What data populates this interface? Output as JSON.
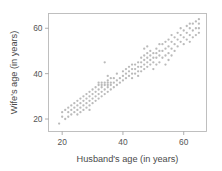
{
  "chart_data": {
    "type": "scatter",
    "title": "",
    "xlabel": "Husband's age (in years)",
    "ylabel": "Wife's age (in years)",
    "xlim": [
      15.5,
      67.5
    ],
    "ylim": [
      14.5,
      66.5
    ],
    "xticks": [
      20,
      40,
      60
    ],
    "yticks": [
      20,
      40,
      60
    ],
    "xticklabels": [
      "20",
      "40",
      "60"
    ],
    "yticklabels": [
      "20",
      "40",
      "60"
    ],
    "grid": false,
    "legend": null,
    "point_color": "#b0b0b0",
    "frame_color": "#b9b9b9",
    "background_color": "#ffffff",
    "series": [
      {
        "name": "couples",
        "n_points": 170,
        "x": [
          19,
          20,
          20,
          21,
          21,
          22,
          22,
          22,
          23,
          23,
          23,
          24,
          24,
          24,
          25,
          25,
          25,
          25,
          26,
          26,
          26,
          26,
          27,
          27,
          27,
          27,
          28,
          28,
          28,
          28,
          29,
          29,
          29,
          29,
          29,
          30,
          30,
          30,
          30,
          31,
          31,
          31,
          31,
          32,
          32,
          32,
          32,
          32,
          33,
          33,
          33,
          33,
          33,
          34,
          34,
          34,
          34,
          34,
          35,
          35,
          35,
          35,
          35,
          35,
          36,
          36,
          36,
          36,
          37,
          37,
          37,
          38,
          38,
          38,
          39,
          39,
          40,
          40,
          40,
          41,
          41,
          41,
          42,
          42,
          42,
          43,
          43,
          43,
          43,
          44,
          44,
          44,
          45,
          45,
          45,
          45,
          46,
          46,
          46,
          46,
          47,
          47,
          47,
          47,
          47,
          48,
          48,
          48,
          48,
          48,
          49,
          49,
          49,
          49,
          50,
          50,
          50,
          50,
          51,
          51,
          51,
          51,
          52,
          52,
          52,
          52,
          53,
          53,
          53,
          54,
          54,
          54,
          54,
          55,
          55,
          55,
          55,
          56,
          56,
          56,
          56,
          57,
          57,
          57,
          58,
          58,
          58,
          59,
          59,
          59,
          60,
          60,
          60,
          61,
          61,
          61,
          62,
          62,
          62,
          62,
          63,
          63,
          63,
          64,
          64,
          64,
          65,
          65,
          65,
          65
        ],
        "y": [
          18,
          21,
          23,
          20,
          24,
          21,
          23,
          25,
          22,
          24,
          26,
          23,
          25,
          27,
          22,
          24,
          26,
          28,
          23,
          25,
          27,
          29,
          24,
          26,
          28,
          30,
          25,
          27,
          29,
          31,
          24,
          26,
          28,
          30,
          32,
          27,
          29,
          31,
          33,
          28,
          30,
          32,
          34,
          29,
          31,
          33,
          35,
          36,
          30,
          32,
          34,
          35,
          36,
          31,
          33,
          35,
          36,
          45,
          32,
          34,
          35,
          36,
          37,
          39,
          33,
          35,
          36,
          38,
          34,
          36,
          38,
          35,
          37,
          40,
          36,
          38,
          37,
          39,
          41,
          38,
          40,
          42,
          39,
          41,
          43,
          38,
          40,
          42,
          44,
          40,
          42,
          44,
          39,
          41,
          43,
          45,
          41,
          43,
          45,
          47,
          42,
          44,
          46,
          48,
          51,
          43,
          45,
          47,
          49,
          52,
          44,
          46,
          48,
          50,
          42,
          45,
          47,
          49,
          44,
          47,
          49,
          51,
          45,
          48,
          50,
          53,
          47,
          50,
          53,
          44,
          48,
          51,
          54,
          46,
          49,
          52,
          55,
          48,
          51,
          54,
          57,
          50,
          53,
          56,
          52,
          55,
          58,
          54,
          57,
          60,
          53,
          56,
          59,
          55,
          58,
          61,
          54,
          57,
          60,
          62,
          56,
          59,
          62,
          57,
          60,
          63,
          58,
          60,
          62,
          64
        ]
      }
    ]
  }
}
